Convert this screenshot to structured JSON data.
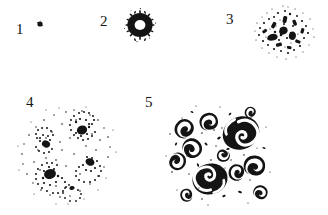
{
  "figure": {
    "background_color": "#ffffff",
    "ink_color": "#141414",
    "width": 328,
    "height": 215,
    "panels": [
      {
        "label": "1",
        "caption": "single point",
        "structure": "point",
        "description": "A single small solid black dot.",
        "element_count": 1
      },
      {
        "label": "2",
        "caption": "ring",
        "structure": "ring",
        "description": "A dense black annulus with a clear round hole and fuzzy radial spikes on the outer rim.",
        "element_count": 1
      },
      {
        "label": "3",
        "caption": "fragmented cluster",
        "structure": "speckle-cluster",
        "description": "An irregular broken cluster of dense black specks and short dashes spreading outward.",
        "element_count": 1
      },
      {
        "label": "4",
        "caption": "multiple small spirals",
        "structure": "spiral-field",
        "description": "A round field of fine dots organised into several small spiral vortices with dotted arms.",
        "element_count": 5
      },
      {
        "label": "5",
        "caption": "large comma spirals",
        "structure": "comma-spiral-field",
        "description": "A round field containing many bold comma shaped spiral blobs, two of them much larger and solid black.",
        "element_count": 12
      }
    ]
  }
}
